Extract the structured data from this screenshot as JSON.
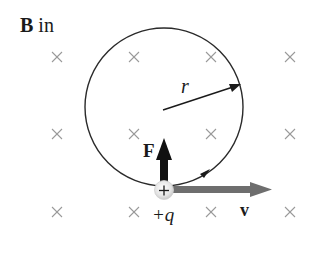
{
  "title": {
    "field_symbol": "B",
    "field_direction": "in"
  },
  "labels": {
    "radius": "r",
    "force": "F",
    "velocity": "v",
    "charge": "+q",
    "charge_sign": "+"
  },
  "field_marks": {
    "symbol": "×",
    "columns_x": [
      57,
      134,
      211,
      290
    ],
    "rows_y": [
      57,
      134,
      212
    ],
    "color": "#9a9a9a"
  },
  "orbit": {
    "cx": 164,
    "cy": 107,
    "r": 79,
    "color": "#2a2a2a"
  },
  "colors": {
    "force_arrow": "#111111",
    "velocity_arrow": "#6e6e6e",
    "charge_fill": "#e6e6e6",
    "text": "#1a1a1a"
  }
}
